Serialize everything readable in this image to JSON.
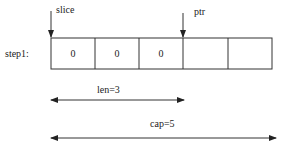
{
  "diagram": {
    "step_label": "step1:",
    "cells": [
      "0",
      "0",
      "0",
      "",
      ""
    ],
    "pointers": {
      "slice": "slice",
      "ptr": "ptr"
    },
    "len_label": "len=3",
    "cap_label": "cap=5",
    "colors": {
      "line": "#333333",
      "background": "#ffffff"
    }
  }
}
